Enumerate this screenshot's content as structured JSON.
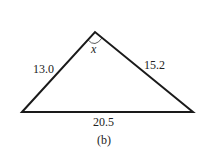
{
  "diagram": {
    "type": "triangle",
    "caption": "(b)",
    "sides": {
      "left": "13.0",
      "right": "15.2",
      "base": "20.5"
    },
    "angle_label": "x",
    "colors": {
      "stroke": "#1a1a1a",
      "text": "#222222",
      "background": "#ffffff"
    }
  }
}
